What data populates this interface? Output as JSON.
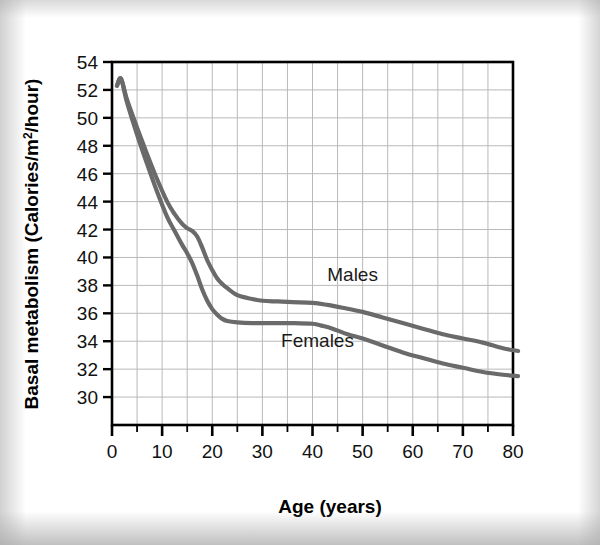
{
  "chart_data": {
    "type": "line",
    "title": "",
    "xlabel": "Age (years)",
    "ylabel": "Basal metabolism (Calories/m²/hour)",
    "ylabel_parts": {
      "before": "Basal metabolism (Calories/m",
      "superscript": "2",
      "after": "/hour)"
    },
    "xlim": [
      0,
      80
    ],
    "ylim": [
      28,
      54
    ],
    "xticks": [
      0,
      10,
      20,
      30,
      40,
      50,
      60,
      70,
      80
    ],
    "xtick_labels": [
      "0",
      "10",
      "20",
      "30",
      "40",
      "50",
      "60",
      "70",
      "80"
    ],
    "x_minor_step": 5,
    "yticks": [
      30,
      32,
      34,
      36,
      38,
      40,
      42,
      44,
      46,
      48,
      50,
      52,
      54
    ],
    "ytick_labels": [
      "30",
      "32",
      "34",
      "36",
      "38",
      "40",
      "42",
      "44",
      "46",
      "48",
      "50",
      "52",
      "54"
    ],
    "grid": true,
    "grid_color": "#b9b9b9",
    "frame_color": "#000000",
    "line_color": "#6a6a6a",
    "line_width": 4.2,
    "legend_position": "inline-annotation",
    "series": [
      {
        "name": "Males",
        "label": "Males",
        "label_x": 48,
        "label_y": 38.3,
        "x": [
          1.0,
          1.8,
          3,
          5,
          7,
          9,
          11,
          12.5,
          14,
          15,
          16,
          17,
          18,
          19,
          20,
          21,
          22,
          23,
          25,
          27,
          30,
          33,
          36,
          40,
          43,
          46,
          50,
          54,
          58,
          62,
          66,
          70,
          74,
          78,
          81
        ],
        "values": [
          52.3,
          52.8,
          51.3,
          49.3,
          47.4,
          45.6,
          44.0,
          43.1,
          42.4,
          42.1,
          41.9,
          41.5,
          40.7,
          39.8,
          39.1,
          38.5,
          38.1,
          37.8,
          37.3,
          37.1,
          36.9,
          36.85,
          36.8,
          36.75,
          36.6,
          36.4,
          36.1,
          35.7,
          35.3,
          34.9,
          34.5,
          34.2,
          33.9,
          33.5,
          33.3
        ]
      },
      {
        "name": "Females",
        "label": "Females",
        "label_x": 41,
        "label_y": 33.6,
        "x": [
          1.0,
          1.8,
          3,
          5,
          7,
          9,
          11,
          12.5,
          14,
          15,
          16,
          17,
          18,
          19,
          20,
          21,
          22,
          23,
          25,
          28,
          32,
          36,
          40,
          42,
          44,
          47,
          50,
          54,
          58,
          62,
          66,
          70,
          74,
          78,
          81
        ],
        "values": [
          52.3,
          52.8,
          51.1,
          48.8,
          46.7,
          44.7,
          42.9,
          41.9,
          40.9,
          40.3,
          39.6,
          38.7,
          37.7,
          36.9,
          36.3,
          35.9,
          35.6,
          35.45,
          35.35,
          35.3,
          35.3,
          35.3,
          35.25,
          35.1,
          34.9,
          34.5,
          34.2,
          33.7,
          33.2,
          32.8,
          32.4,
          32.1,
          31.8,
          31.6,
          31.5
        ]
      }
    ],
    "annotations": [
      {
        "text": "Males",
        "x": 48,
        "y": 38.3
      },
      {
        "text": "Females",
        "x": 41,
        "y": 33.6
      }
    ]
  }
}
